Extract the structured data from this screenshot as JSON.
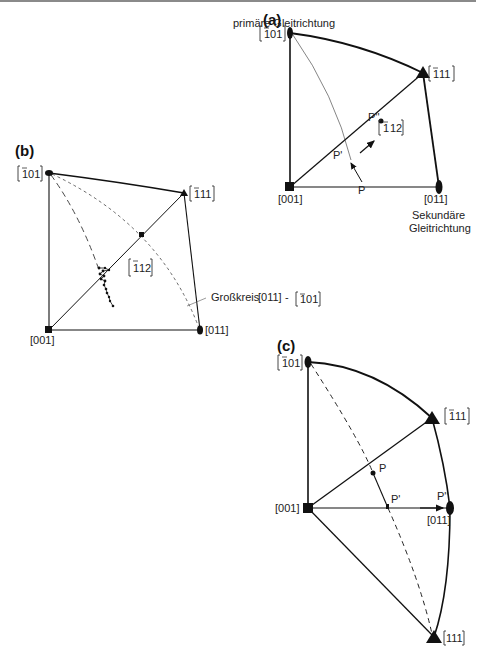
{
  "figure": {
    "panels": [
      {
        "id": "a",
        "label": "(a)",
        "poles": {
          "p_101": "[̅101]",
          "p_111": "[̅111]",
          "p_001": "[001]",
          "p_011": "[011]",
          "p_112": "[̅112]"
        },
        "pole_text": {
          "m101": "101",
          "m111": "11",
          "m112": "12",
          "bar1": "1"
        },
        "annotations": {
          "primary": "primäre Gleitrichtung",
          "secondary_1": "Sekundäre",
          "secondary_2": "Gleitrichtung",
          "P": "P",
          "P1": "P'",
          "P2": "P''"
        }
      },
      {
        "id": "b",
        "label": "(b)",
        "poles": {
          "p_001": "[001]",
          "p_011": "[011]"
        },
        "annotations": {
          "great_circle": "Großkreis",
          "gc_from": "[011]",
          "gc_dash": "-"
        }
      },
      {
        "id": "c",
        "label": "(c)",
        "poles": {
          "p_001": "[001]",
          "p_011": "[011]",
          "p_111": "[111]"
        },
        "annotations": {
          "P": "P",
          "P1": "P'",
          "P2": "P''"
        }
      }
    ]
  }
}
